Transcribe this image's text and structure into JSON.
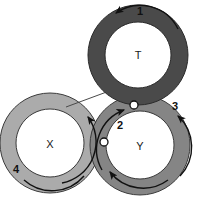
{
  "diagram": {
    "type": "three-overlapping-annuli-cycle-diagram",
    "background_color": "#ffffff",
    "outline_color": "#3a3a3a",
    "arrow_color": "#111111",
    "canvas": {
      "width": 202,
      "height": 203
    },
    "rings": [
      {
        "id": "ring-t",
        "label": "T",
        "label_x": 138,
        "label_y": 55,
        "center_x": 138,
        "center_y": 55,
        "inner_radius": 33,
        "outer_radius": 50,
        "fill_color": "#4a4a4a",
        "inner_fill_color": "#ffffff"
      },
      {
        "id": "ring-y",
        "label": "Y",
        "label_x": 140,
        "label_y": 147,
        "center_x": 140,
        "center_y": 145,
        "inner_radius": 34,
        "outer_radius": 50,
        "fill_color": "#858585",
        "inner_fill_color": "#ffffff"
      },
      {
        "id": "ring-x",
        "label": "X",
        "label_x": 50,
        "label_y": 145,
        "center_x": 50,
        "center_y": 143,
        "inner_radius": 34,
        "outer_radius": 50,
        "fill_color": "#ababab",
        "inner_fill_color": "#ffffff"
      }
    ],
    "arc_numbers": [
      {
        "id": "arc-number-1",
        "text": "1",
        "x": 140,
        "y": 12
      },
      {
        "id": "arc-number-2",
        "text": "2",
        "x": 120,
        "y": 126
      },
      {
        "id": "arc-number-3",
        "text": "3",
        "x": 175,
        "y": 107
      },
      {
        "id": "arc-number-4",
        "text": "4",
        "x": 16,
        "y": 170
      }
    ],
    "node_markers": [
      {
        "id": "node-marker-upper",
        "x": 134,
        "y": 105,
        "radius": 4
      },
      {
        "id": "node-marker-lower",
        "x": 104,
        "y": 142,
        "radius": 4
      }
    ],
    "connector_line": {
      "id": "connector-x-to-t",
      "x1": 66,
      "y1": 107,
      "x2": 112,
      "y2": 90
    }
  }
}
